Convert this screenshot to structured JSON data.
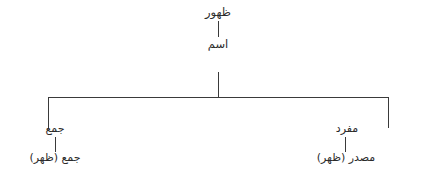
{
  "diagram": {
    "title_node": "ظهور",
    "pos_node": "اسم",
    "branches": {
      "left": {
        "label": "جمع",
        "example": "جمع (ظهر)"
      },
      "right": {
        "label": "مفرد",
        "example": "مصدر (ظهر)"
      }
    },
    "line_color": "#3a3a3a",
    "text_color": "#2b2b2b",
    "background_color": "#ffffff"
  }
}
